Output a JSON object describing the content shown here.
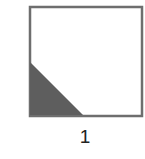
{
  "figure": {
    "label": "1",
    "square": {
      "x": 29,
      "y": 6,
      "size": 114,
      "stroke": "#6e6e6e",
      "fill": "#ffffff"
    },
    "shaded_triangle": {
      "points": [
        [
          30,
          62
        ],
        [
          30,
          115
        ],
        [
          83,
          115
        ]
      ],
      "fill": "#5e5e5e",
      "corner": "bottom-left"
    }
  }
}
